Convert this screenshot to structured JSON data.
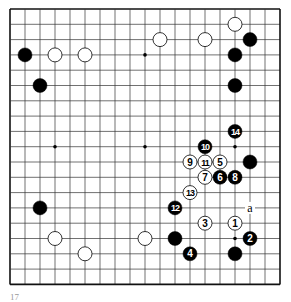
{
  "board": {
    "size": 19,
    "origin_x": 10,
    "origin_y": 9,
    "spacing_x": 15,
    "spacing_y": 15.3,
    "line_color": "#333333",
    "border_color": "#111111",
    "background": "#ffffff",
    "hoshi": [
      [
        3,
        3
      ],
      [
        9,
        3
      ],
      [
        15,
        3
      ],
      [
        3,
        9
      ],
      [
        9,
        9
      ],
      [
        15,
        9
      ],
      [
        3,
        15
      ],
      [
        9,
        15
      ],
      [
        15,
        15
      ]
    ]
  },
  "stones": [
    {
      "color": "black",
      "col": 1,
      "row": 3,
      "label": ""
    },
    {
      "color": "white",
      "col": 3,
      "row": 3,
      "label": ""
    },
    {
      "color": "white",
      "col": 5,
      "row": 3,
      "label": ""
    },
    {
      "color": "black",
      "col": 2,
      "row": 5,
      "label": ""
    },
    {
      "color": "white",
      "col": 10,
      "row": 2,
      "label": ""
    },
    {
      "color": "white",
      "col": 13,
      "row": 2,
      "label": ""
    },
    {
      "color": "white",
      "col": 15,
      "row": 1,
      "label": ""
    },
    {
      "color": "black",
      "col": 16,
      "row": 2,
      "label": ""
    },
    {
      "color": "black",
      "col": 15,
      "row": 3,
      "label": ""
    },
    {
      "color": "black",
      "col": 15,
      "row": 5,
      "label": ""
    },
    {
      "color": "black",
      "col": 15,
      "row": 8,
      "label": "14"
    },
    {
      "color": "black",
      "col": 13,
      "row": 9,
      "label": "10"
    },
    {
      "color": "white",
      "col": 12,
      "row": 10,
      "label": "9"
    },
    {
      "color": "white",
      "col": 13,
      "row": 10,
      "label": "11"
    },
    {
      "color": "white",
      "col": 14,
      "row": 10,
      "label": "5"
    },
    {
      "color": "black",
      "col": 16,
      "row": 10,
      "label": ""
    },
    {
      "color": "white",
      "col": 13,
      "row": 11,
      "label": "7"
    },
    {
      "color": "black",
      "col": 14,
      "row": 11,
      "label": "6"
    },
    {
      "color": "black",
      "col": 15,
      "row": 11,
      "label": "8"
    },
    {
      "color": "white",
      "col": 12,
      "row": 12,
      "label": "13"
    },
    {
      "color": "black",
      "col": 11,
      "row": 13,
      "label": "12"
    },
    {
      "color": "white",
      "col": 13,
      "row": 14,
      "label": "3"
    },
    {
      "color": "white",
      "col": 15,
      "row": 14,
      "label": "1"
    },
    {
      "color": "black",
      "col": 11,
      "row": 15,
      "label": ""
    },
    {
      "color": "black",
      "col": 16,
      "row": 15,
      "label": "2"
    },
    {
      "color": "black",
      "col": 12,
      "row": 16,
      "label": "4"
    },
    {
      "color": "black",
      "col": 15,
      "row": 16,
      "label": ""
    },
    {
      "color": "black",
      "col": 2,
      "row": 13,
      "label": ""
    },
    {
      "color": "white",
      "col": 3,
      "row": 15,
      "label": ""
    },
    {
      "color": "white",
      "col": 5,
      "row": 16,
      "label": ""
    },
    {
      "color": "white",
      "col": 9,
      "row": 15,
      "label": ""
    }
  ],
  "marks": [
    {
      "col": 16,
      "row": 13,
      "label": "a"
    }
  ],
  "caption": "17"
}
